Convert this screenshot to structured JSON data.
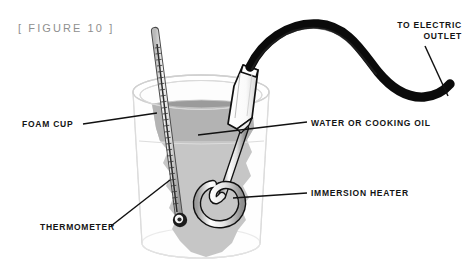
{
  "figure": {
    "caption": "[ FIGURE 10 ]",
    "caption_color": "#8f8f8f",
    "background_color": "#ffffff"
  },
  "labels": {
    "foam_cup": "FOAM CUP",
    "thermometer": "THERMOMETER",
    "water_or_cooking_oil": "WATER OR COOKING OIL",
    "immersion_heater": "IMMERSION HEATER",
    "to_electric_outlet_line1": "TO ELECTRIC",
    "to_electric_outlet_line2": "OUTLET",
    "label_color": "#141414"
  },
  "diagram": {
    "cup": {
      "name": "foam-cup",
      "fill": "#fdfdfd",
      "stroke": "#d5d5d5"
    },
    "liquid": {
      "name": "water-or-cooking-oil",
      "upper_fill": "#8c8c8c",
      "lower_fill": "#a9a9a9",
      "surface_stroke": "#cfcfcf"
    },
    "thermometer": {
      "name": "thermometer",
      "tube_fill": "#e8e8e8",
      "tube_stroke": "#4a4a4a",
      "bulb_fill": "#1c1c1c",
      "tick_color": "#3a3a3a"
    },
    "heater": {
      "name": "immersion-heater",
      "handle_fill": "#ffffff",
      "handle_stroke": "#111111",
      "rod_fill": "#f2f2f2",
      "rod_stroke": "#111111"
    },
    "cord": {
      "name": "power-cord",
      "stroke": "#0b0b0b",
      "width": 9
    },
    "leader_lines": {
      "stroke": "#111111",
      "width": 1.4
    }
  }
}
